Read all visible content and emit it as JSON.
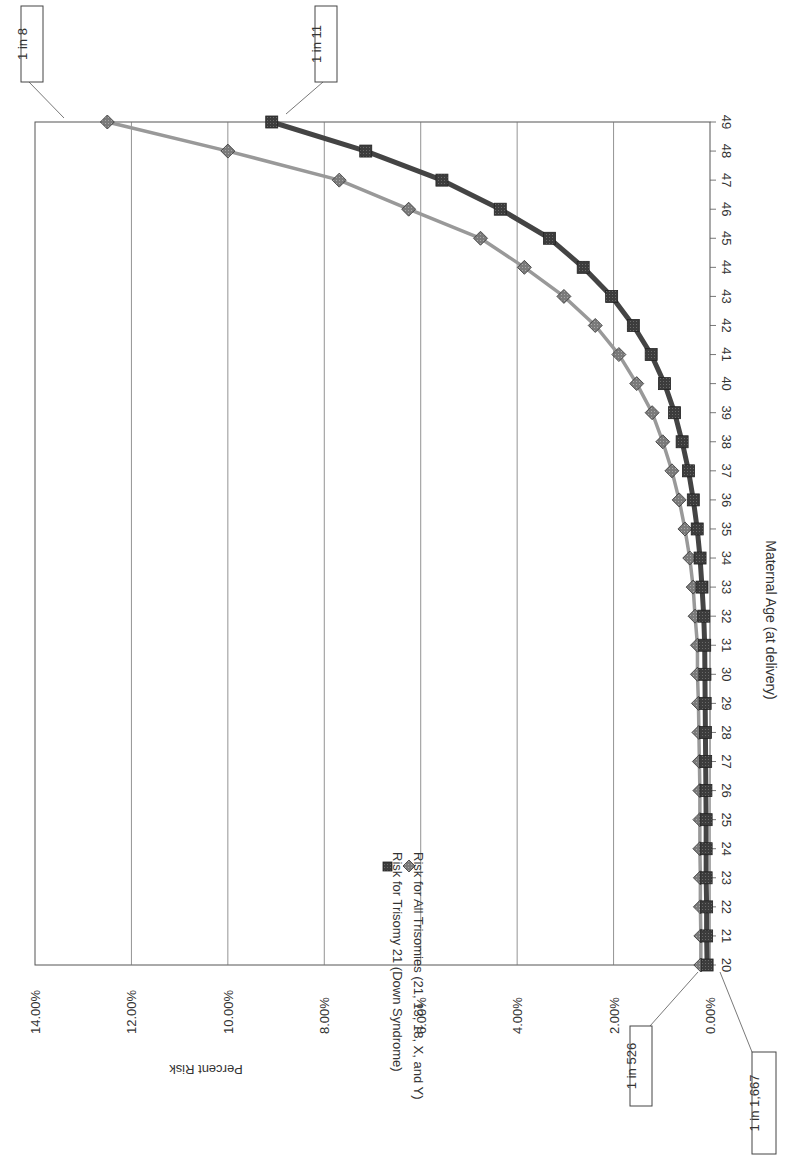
{
  "chart_data": {
    "type": "line",
    "title": "",
    "xlabel": "Maternal Age (at delivery)",
    "ylabel": "Percent Risk",
    "x": [
      20,
      21,
      22,
      23,
      24,
      25,
      26,
      27,
      28,
      29,
      30,
      31,
      32,
      33,
      34,
      35,
      36,
      37,
      38,
      39,
      40,
      41,
      42,
      43,
      44,
      45,
      46,
      47,
      48,
      49
    ],
    "ylim": [
      0,
      14
    ],
    "yticks": [
      "0.00%",
      "2.00%",
      "4.00%",
      "6.00%",
      "8.00%",
      "10.00%",
      "12.00%",
      "14.00%"
    ],
    "grid": "vertical gridlines at each y tick (chart rotated 90° clockwise)",
    "legend_position": "inside plot, center-left",
    "series": [
      {
        "name": "Risk for Trisomy 21 (Down Syndrome)",
        "marker": "square",
        "color": "#4a4a4a",
        "values": [
          0.06,
          0.07,
          0.07,
          0.08,
          0.08,
          0.08,
          0.085,
          0.09,
          0.095,
          0.1,
          0.105,
          0.11,
          0.13,
          0.166,
          0.206,
          0.265,
          0.346,
          0.446,
          0.578,
          0.735,
          0.943,
          1.22,
          1.59,
          2.04,
          2.63,
          3.33,
          4.35,
          5.56,
          7.14,
          9.09
        ]
      },
      {
        "name": "Risk for All Trisomies (21, 13, 18, X, and Y)",
        "marker": "diamond",
        "color": "#8a8a8a",
        "values": [
          0.19,
          0.19,
          0.2,
          0.2,
          0.21,
          0.21,
          0.21,
          0.22,
          0.23,
          0.24,
          0.26,
          0.26,
          0.31,
          0.35,
          0.42,
          0.52,
          0.64,
          0.79,
          0.98,
          1.2,
          1.52,
          1.89,
          2.38,
          3.03,
          3.85,
          4.76,
          6.25,
          7.69,
          10.0,
          12.5
        ]
      }
    ],
    "annotations": [
      {
        "text": "1 in 8",
        "series": 1,
        "x": 49
      },
      {
        "text": "1 in 11",
        "series": 0,
        "x": 49
      },
      {
        "text": "1 in 526",
        "series": 1,
        "x": 20
      },
      {
        "text": "1 in 1,667",
        "series": 0,
        "x": 20
      }
    ]
  }
}
